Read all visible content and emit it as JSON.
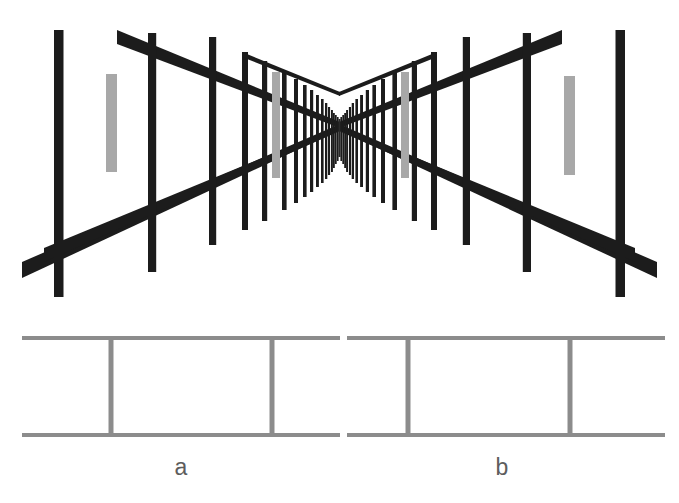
{
  "figure": {
    "background_color": "#ffffff",
    "structure_color": "#1c1c1c",
    "test_bar_color": "#a8a8a8",
    "schematic_color": "#8c8c8c",
    "label_color": "#5d5d5d"
  },
  "perspective_panel": {
    "name": "perspective-corridor-scene",
    "description": "Two mirror-symmetric converging fence corridors meeting at a central vanishing point",
    "vanishing_point": {
      "x": 340,
      "y": 125
    },
    "left_corridor": {
      "post_count": 17,
      "near_post_x": 58,
      "near_post_top_y": 30,
      "near_post_bottom_y": 297,
      "top_rail_near_y": 36,
      "bottom_rail_near_y": 253,
      "test_bar": {
        "x": 272,
        "width": 8,
        "top_y": 72,
        "bottom_y": 178,
        "color": "#a8a8a8"
      },
      "reference_bar": {
        "x": 106,
        "width": 11,
        "top_y": 74,
        "bottom_y": 172,
        "color": "#a8a8a8"
      }
    },
    "right_corridor": {
      "post_count": 17,
      "near_post_x": 621,
      "near_post_top_y": 30,
      "near_post_bottom_y": 297,
      "top_rail_near_y": 36,
      "bottom_rail_near_y": 253,
      "test_bar": {
        "x": 401,
        "width": 8,
        "top_y": 72,
        "bottom_y": 178,
        "color": "#a8a8a8"
      },
      "reference_bar": {
        "x": 564,
        "width": 11,
        "top_y": 76,
        "bottom_y": 175,
        "color": "#a8a8a8"
      }
    }
  },
  "schematic_panel": {
    "name": "schematic-comparison-panel",
    "description": "Two equal-width rungs between parallel rails, labelled a and b",
    "rail_color": "#8c8c8c",
    "stroke_width": 4,
    "top_rail_y": 26,
    "bottom_rail_y": 123,
    "segment_a": {
      "label": "a",
      "rail_left_x": 22,
      "rail_right_x": 340,
      "rung_left_x": 109,
      "rung_right_x": 272,
      "label_x": 181,
      "label_y": 160,
      "width_px": 163
    },
    "segment_b": {
      "label": "b",
      "rail_left_x": 346,
      "rail_right_x": 665,
      "rung_left_x": 407,
      "rung_right_x": 570,
      "label_x": 502,
      "label_y": 160,
      "width_px": 163
    }
  },
  "labels": {
    "segment_a_label": "a",
    "segment_b_label": "b"
  }
}
